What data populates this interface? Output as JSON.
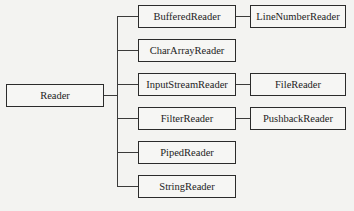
{
  "diagram": {
    "root": {
      "label": "Reader"
    },
    "children": [
      {
        "label": "BufferedReader",
        "subclass": "LineNumberReader"
      },
      {
        "label": "CharArrayReader",
        "subclass": null
      },
      {
        "label": "InputStreamReader",
        "subclass": "FileReader"
      },
      {
        "label": "FilterReader",
        "subclass": "PushbackReader"
      },
      {
        "label": "PipedReader",
        "subclass": null
      },
      {
        "label": "StringReader",
        "subclass": null
      }
    ],
    "colors": {
      "background": "#f3f3f1",
      "border": "#2b2b2b",
      "text": "#1d1d1d"
    }
  }
}
